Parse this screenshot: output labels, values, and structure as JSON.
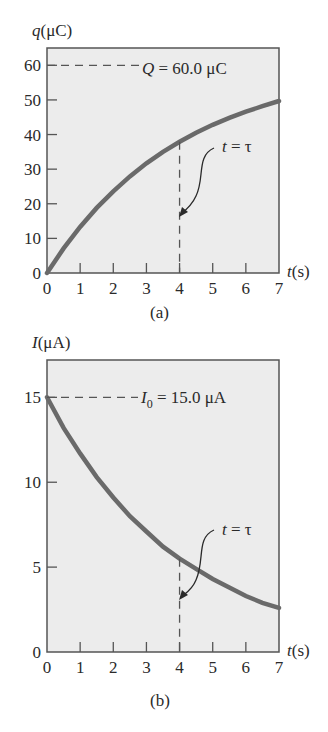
{
  "chart_data": [
    {
      "type": "line",
      "panel_label": "(a)",
      "ylabel": "q(μC)",
      "xlabel": "t (s)",
      "x_ticks": [
        0,
        1,
        2,
        3,
        4,
        5,
        6,
        7
      ],
      "y_ticks": [
        0,
        10,
        20,
        30,
        40,
        50,
        60
      ],
      "xlim": [
        0,
        7
      ],
      "ylim": [
        0,
        65
      ],
      "series": [
        {
          "name": "q(t)",
          "x": [
            0,
            0.5,
            1,
            1.5,
            2,
            2.5,
            3,
            3.5,
            4,
            4.5,
            5,
            5.5,
            6,
            6.5,
            7
          ],
          "values": [
            0,
            7.1,
            13.3,
            18.8,
            23.6,
            27.9,
            31.7,
            35.0,
            37.9,
            40.5,
            42.8,
            44.8,
            46.6,
            48.2,
            49.7
          ]
        }
      ],
      "annotations": [
        {
          "text": "Q = 60.0 μC",
          "type": "dashed-hline",
          "y": 60
        },
        {
          "text": "t = τ",
          "type": "dashed-vline",
          "x": 4
        }
      ],
      "grid": false
    },
    {
      "type": "line",
      "panel_label": "(b)",
      "ylabel": "I(μA)",
      "xlabel": "t (s)",
      "x_ticks": [
        0,
        1,
        2,
        3,
        4,
        5,
        6,
        7
      ],
      "y_ticks": [
        0,
        5,
        10,
        15
      ],
      "xlim": [
        0,
        7
      ],
      "ylim": [
        0,
        17.2
      ],
      "series": [
        {
          "name": "I(t)",
          "x": [
            0,
            0.5,
            1,
            1.5,
            2,
            2.5,
            3,
            3.5,
            4,
            4.5,
            5,
            5.5,
            6,
            6.5,
            7
          ],
          "values": [
            15,
            13.2,
            11.7,
            10.3,
            9.1,
            8.0,
            7.1,
            6.2,
            5.5,
            4.9,
            4.3,
            3.8,
            3.3,
            2.9,
            2.6
          ]
        }
      ],
      "annotations": [
        {
          "text": "I0 = 15.0 μA",
          "type": "dashed-hline",
          "y": 15
        },
        {
          "text": "t = τ",
          "type": "dashed-vline",
          "x": 4
        }
      ],
      "grid": false
    }
  ],
  "labels": {
    "a": {
      "ylabel_q": "q",
      "ylabel_unit": "(μC)",
      "annot": "Q = 60.0 μC",
      "Q": "Q",
      "annot_rest": " = 60.0 μC",
      "tau_t": "t",
      "tau_rest": " = τ",
      "xlabel_t": "t",
      "xlabel_unit": "(s)",
      "panel": "(a)"
    },
    "b": {
      "ylabel_I": "I",
      "ylabel_unit": "(μA)",
      "I": "I",
      "sub": "0",
      "annot_rest": " = 15.0 μA",
      "tau_t": "t",
      "tau_rest": " = τ",
      "xlabel_t": "t",
      "xlabel_unit": "(s)",
      "panel": "(b)"
    }
  },
  "colors": {
    "plot_bg": "#ececec",
    "curve": "#6a6a6a",
    "axis": "#555555",
    "text": "#2a2a2a"
  }
}
